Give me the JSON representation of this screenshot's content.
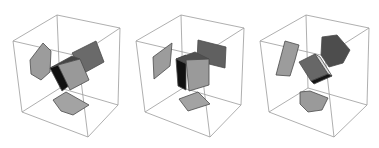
{
  "figure": {
    "panels": [
      {
        "id": "panel-1",
        "box_edges": [
          [
            [
              13,
              41
            ],
            [
              57,
              15
            ]
          ],
          [
            [
              57,
              15
            ],
            [
              120,
              28
            ]
          ],
          [
            [
              13,
              41
            ],
            [
              78,
              56
            ]
          ],
          [
            [
              78,
              56
            ],
            [
              120,
              28
            ]
          ],
          [
            [
              13,
              41
            ],
            [
              22,
              112
            ]
          ],
          [
            [
              78,
              56
            ],
            [
              88,
              137
            ]
          ],
          [
            [
              120,
              28
            ],
            [
              118,
              105
            ]
          ],
          [
            [
              22,
              112
            ],
            [
              88,
              137
            ]
          ],
          [
            [
              88,
              137
            ],
            [
              118,
              105
            ]
          ],
          [
            [
              57,
              15
            ],
            [
              60,
              88
            ]
          ],
          [
            [
              60,
              88
            ],
            [
              22,
              112
            ]
          ],
          [
            [
              60,
              88
            ],
            [
              118,
              105
            ]
          ]
        ],
        "faces": [
          {
            "name": "left-projection",
            "color": "#9c9c9c",
            "points": [
              [
                30,
                60
              ],
              [
                43,
                43
              ],
              [
                51,
                51
              ],
              [
                50,
                72
              ],
              [
                41,
                80
              ],
              [
                31,
                74
              ]
            ]
          },
          {
            "name": "back-projection",
            "color": "#6a6a6a",
            "points": [
              [
                72,
                53
              ],
              [
                96,
                41
              ],
              [
                104,
                62
              ],
              [
                84,
                73
              ]
            ]
          },
          {
            "name": "bottom-projection",
            "color": "#a3a3a3",
            "points": [
              [
                53,
                100
              ],
              [
                66,
                92
              ],
              [
                89,
                105
              ],
              [
                73,
                115
              ],
              [
                61,
                111
              ]
            ]
          },
          {
            "name": "cube-left-face",
            "color": "#111111",
            "points": [
              [
                50,
                68
              ],
              [
                58,
                65
              ],
              [
                70,
                85
              ],
              [
                62,
                91
              ]
            ]
          },
          {
            "name": "cube-top-face",
            "color": "#454545",
            "points": [
              [
                50,
                68
              ],
              [
                72,
                56
              ],
              [
                80,
                59
              ],
              [
                58,
                65
              ]
            ]
          },
          {
            "name": "cube-front-face",
            "color": "#999999",
            "points": [
              [
                58,
                65
              ],
              [
                80,
                59
              ],
              [
                89,
                80
              ],
              [
                70,
                90
              ]
            ]
          }
        ]
      },
      {
        "id": "panel-2",
        "box_edges": [
          [
            [
              136,
              41
            ],
            [
              181,
              15
            ]
          ],
          [
            [
              181,
              15
            ],
            [
              244,
              28
            ]
          ],
          [
            [
              136,
              41
            ],
            [
              200,
              56
            ]
          ],
          [
            [
              200,
              56
            ],
            [
              244,
              28
            ]
          ],
          [
            [
              136,
              41
            ],
            [
              145,
              112
            ]
          ],
          [
            [
              200,
              56
            ],
            [
              210,
              137
            ]
          ],
          [
            [
              244,
              28
            ],
            [
              241,
              105
            ]
          ],
          [
            [
              145,
              112
            ],
            [
              210,
              137
            ]
          ],
          [
            [
              210,
              137
            ],
            [
              241,
              105
            ]
          ],
          [
            [
              181,
              15
            ],
            [
              183,
              88
            ]
          ],
          [
            [
              183,
              88
            ],
            [
              145,
              112
            ]
          ],
          [
            [
              183,
              88
            ],
            [
              241,
              105
            ]
          ]
        ],
        "faces": [
          {
            "name": "left-projection",
            "color": "#9c9c9c",
            "points": [
              [
                153,
                57
              ],
              [
                172,
                43
              ],
              [
                170,
                66
              ],
              [
                154,
                79
              ]
            ]
          },
          {
            "name": "back-projection",
            "color": "#606060",
            "points": [
              [
                198,
                40
              ],
              [
                226,
                47
              ],
              [
                225,
                68
              ],
              [
                197,
                61
              ]
            ]
          },
          {
            "name": "bottom-projection",
            "color": "#a3a3a3",
            "points": [
              [
                179,
                99
              ],
              [
                198,
                92
              ],
              [
                210,
                104
              ],
              [
                188,
                111
              ]
            ]
          },
          {
            "name": "cube-left-face",
            "color": "#111111",
            "points": [
              [
                176,
                59
              ],
              [
                186,
                55
              ],
              [
                186,
                90
              ],
              [
                178,
                86
              ]
            ]
          },
          {
            "name": "cube-top-face",
            "color": "#505050",
            "points": [
              [
                176,
                59
              ],
              [
                195,
                52
              ],
              [
                209,
                59
              ],
              [
                189,
                65
              ]
            ]
          },
          {
            "name": "cube-front-face",
            "color": "#9a9a9a",
            "points": [
              [
                186,
                60
              ],
              [
                209,
                59
              ],
              [
                209,
                85
              ],
              [
                189,
                91
              ]
            ]
          }
        ]
      },
      {
        "id": "panel-3",
        "box_edges": [
          [
            [
              260,
              41
            ],
            [
              306,
              15
            ]
          ],
          [
            [
              306,
              15
            ],
            [
              369,
              28
            ]
          ],
          [
            [
              260,
              41
            ],
            [
              325,
              56
            ]
          ],
          [
            [
              325,
              56
            ],
            [
              369,
              28
            ]
          ],
          [
            [
              260,
              41
            ],
            [
              269,
              112
            ]
          ],
          [
            [
              325,
              56
            ],
            [
              334,
              137
            ]
          ],
          [
            [
              369,
              28
            ],
            [
              367,
              105
            ]
          ],
          [
            [
              269,
              112
            ],
            [
              334,
              137
            ]
          ],
          [
            [
              334,
              137
            ],
            [
              367,
              105
            ]
          ],
          [
            [
              306,
              15
            ],
            [
              308,
              88
            ]
          ],
          [
            [
              308,
              88
            ],
            [
              269,
              112
            ]
          ],
          [
            [
              308,
              88
            ],
            [
              367,
              105
            ]
          ]
        ],
        "faces": [
          {
            "name": "left-projection",
            "color": "#9c9c9c",
            "points": [
              [
                285,
                41
              ],
              [
                299,
                45
              ],
              [
                295,
                60
              ],
              [
                290,
                76
              ],
              [
                276,
                75
              ]
            ]
          },
          {
            "name": "back-projection",
            "color": "#4d4d4d",
            "points": [
              [
                322,
                37
              ],
              [
                337,
                35
              ],
              [
                350,
                50
              ],
              [
                343,
                63
              ],
              [
                329,
                67
              ],
              [
                321,
                55
              ]
            ]
          },
          {
            "name": "bottom-projection",
            "color": "#9a9a9a",
            "points": [
              [
                300,
                92
              ],
              [
                310,
                91
              ],
              [
                328,
                98
              ],
              [
                322,
                110
              ],
              [
                308,
                112
              ],
              [
                300,
                104
              ]
            ]
          },
          {
            "name": "cube-front-face",
            "color": "#676767",
            "points": [
              [
                299,
                62
              ],
              [
                315,
                54
              ],
              [
                328,
                74
              ],
              [
                311,
                81
              ]
            ]
          },
          {
            "name": "cube-side-face",
            "color": "#dcdcdc",
            "points": [
              [
                315,
                54
              ],
              [
                320,
                57
              ],
              [
                332,
                76
              ],
              [
                328,
                74
              ]
            ]
          },
          {
            "name": "cube-bottom-face",
            "color": "#151515",
            "points": [
              [
                311,
                81
              ],
              [
                328,
                74
              ],
              [
                332,
                76
              ],
              [
                314,
                84
              ]
            ]
          }
        ]
      }
    ]
  }
}
